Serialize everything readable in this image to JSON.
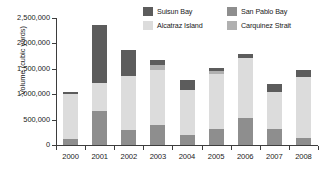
{
  "chart_data": {
    "type": "bar",
    "stacked": true,
    "title": "",
    "xlabel": "",
    "ylabel": "Volume (cubic yards)",
    "ylim": [
      0,
      2500000
    ],
    "ytick_values": [
      0,
      500000,
      1000000,
      1500000,
      2000000,
      2500000
    ],
    "ytick_labels": [
      "0",
      "500,000",
      "1,000,000",
      "1,500,000",
      "2,000,000",
      "2,500,000"
    ],
    "grid": false,
    "legend_position": "top-right",
    "categories": [
      "2000",
      "2001",
      "2002",
      "2003",
      "2004",
      "2005",
      "2006",
      "2007",
      "2008"
    ],
    "series": [
      {
        "name": "San Pablo Bay",
        "color": "#8e8e8e",
        "values": [
          110000,
          660000,
          290000,
          400000,
          200000,
          320000,
          540000,
          315000,
          145000
        ]
      },
      {
        "name": "Alcatraz Island",
        "color": "#dcdcdc",
        "values": [
          890000,
          560000,
          1070000,
          1070000,
          880000,
          1080000,
          1180000,
          735000,
          1195000
        ]
      },
      {
        "name": "Carquinez Strait",
        "color": "#b0b0b0",
        "values": [
          0,
          0,
          0,
          100000,
          0,
          60000,
          0,
          0,
          0
        ]
      },
      {
        "name": "Suisun Bay",
        "color": "#5c5c5c",
        "values": [
          40000,
          1150000,
          520000,
          110000,
          205000,
          60000,
          70000,
          150000,
          140000
        ]
      }
    ],
    "totals": [
      1040000,
      2370000,
      1880000,
      1680000,
      1285000,
      1520000,
      1790000,
      1200000,
      1480000
    ]
  },
  "legend": {
    "entries": [
      {
        "label": "Suisun Bay",
        "color": "#5c5c5c"
      },
      {
        "label": "San Pablo Bay",
        "color": "#8e8e8e"
      },
      {
        "label": "Alcatraz Island",
        "color": "#dcdcdc"
      },
      {
        "label": "Carquinez Strait",
        "color": "#b0b0b0"
      }
    ]
  },
  "colors": {
    "axis": "#3d3d3d",
    "text": "#1a1a1a",
    "background": "#ffffff"
  }
}
